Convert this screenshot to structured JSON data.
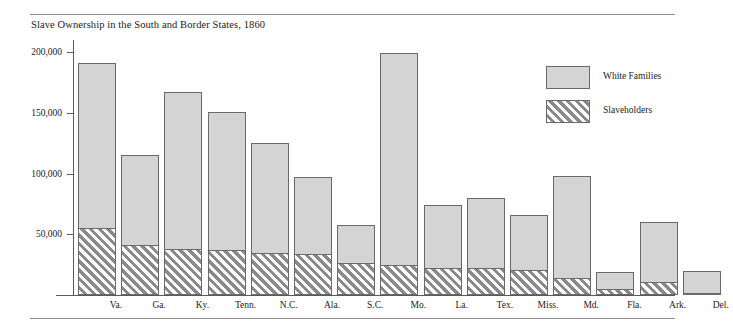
{
  "chart_data": {
    "type": "bar",
    "title": "Slave Ownership in the South and Border States, 1860",
    "xlabel": "",
    "ylabel": "",
    "ylim": [
      0,
      210000
    ],
    "grid": false,
    "legend_position": "right",
    "stacked": false,
    "yticks": [
      50000,
      100000,
      150000,
      200000
    ],
    "ytick_labels": [
      "50,000",
      "100,000",
      "150,000",
      "200,000"
    ],
    "categories": [
      "Va.",
      "Ga.",
      "Ky.",
      "Tenn.",
      "N.C.",
      "Ala.",
      "S.C.",
      "Mo.",
      "La.",
      "Tex.",
      "Miss.",
      "Md.",
      "Fla.",
      "Ark.",
      "Del."
    ],
    "series": [
      {
        "name": "White Families",
        "color": "#d4d4d4",
        "values": [
          191000,
          115000,
          167000,
          151000,
          125000,
          97000,
          58000,
          199000,
          74000,
          80000,
          66000,
          98000,
          19000,
          60000,
          20000
        ]
      },
      {
        "name": "Slaveholders",
        "color": "#8a8a8a",
        "values": [
          55000,
          41000,
          38000,
          37000,
          35000,
          34000,
          26000,
          25000,
          22000,
          22000,
          21000,
          14000,
          5000,
          11000,
          600
        ]
      }
    ],
    "legend": [
      {
        "label": "White Families",
        "swatch": "solid-gray"
      },
      {
        "label": "Slaveholders",
        "swatch": "diagonal-hatch"
      }
    ]
  },
  "colors": {
    "bar_fill": "#d4d4d4",
    "bar_border": "#6a6a6a",
    "hatch": "#8a8a8a",
    "axis": "#5a5a5a",
    "rule": "#8d8d8d",
    "text": "#1a1a1a"
  }
}
